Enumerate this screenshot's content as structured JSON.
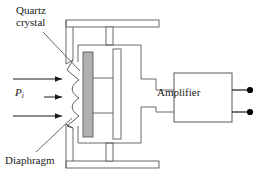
{
  "figure": {
    "type": "piezoelectric-pressure-transducer-schematic",
    "background_color": "#ffffff",
    "line_color": "#595959",
    "text_color": "#1a1a1a",
    "crystal_fill_color": "#b0b0b0",
    "terminal_color": "#000000"
  },
  "labels": {
    "quartz_crystal_line1": "Quartz",
    "quartz_crystal_line2": "crystal",
    "diaphragm": "Diaphragm",
    "pressure_symbol": "P",
    "pressure_subscript": "i",
    "amplifier": "Amplifier"
  },
  "components": {
    "quartz_crystal": "quartz-crystal-bar",
    "backing_plate": "backing-plate-bar",
    "diaphragm": "corrugated-diaphragm",
    "housing": "transducer-housing",
    "amplifier": "amplifier-box",
    "pressure_arrows": 3,
    "output_terminals": 2
  }
}
